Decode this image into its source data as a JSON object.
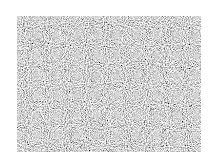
{
  "image": {
    "description": "Grayscale random noise texture on white background",
    "background_color": "#ffffff",
    "noise_region": {
      "x": 17,
      "y": 16,
      "width": 184,
      "height": 136
    },
    "noise_tone_range": [
      "#3a3a3a",
      "#f0f0f0"
    ],
    "mean_tone": "#9a9a9a"
  }
}
